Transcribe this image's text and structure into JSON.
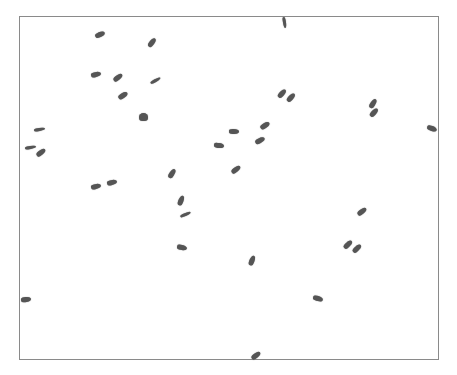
{
  "image": {
    "width": 457,
    "height": 375,
    "background": "#ffffff",
    "frame": {
      "left": 19,
      "top": 16,
      "right": 439,
      "bottom": 360,
      "border_color": "#8a8a8a"
    },
    "particle_color": "#555555",
    "particles": [
      {
        "x": 100,
        "y": 34,
        "angle": -25,
        "shape": "normal"
      },
      {
        "x": 152,
        "y": 42,
        "angle": -55,
        "shape": "normal"
      },
      {
        "x": 284,
        "y": 22,
        "angle": 80,
        "shape": "thin"
      },
      {
        "x": 96,
        "y": 74,
        "angle": -15,
        "shape": "normal"
      },
      {
        "x": 118,
        "y": 77,
        "angle": -40,
        "shape": "normal"
      },
      {
        "x": 155,
        "y": 80,
        "angle": -30,
        "shape": "thin"
      },
      {
        "x": 123,
        "y": 95,
        "angle": -35,
        "shape": "normal"
      },
      {
        "x": 143,
        "y": 117,
        "angle": 0,
        "shape": "blob"
      },
      {
        "x": 282,
        "y": 93,
        "angle": -50,
        "shape": "normal"
      },
      {
        "x": 291,
        "y": 97,
        "angle": -50,
        "shape": "normal"
      },
      {
        "x": 373,
        "y": 103,
        "angle": -60,
        "shape": "normal"
      },
      {
        "x": 374,
        "y": 112,
        "angle": -50,
        "shape": "normal"
      },
      {
        "x": 432,
        "y": 128,
        "angle": 20,
        "shape": "normal"
      },
      {
        "x": 39,
        "y": 129,
        "angle": -10,
        "shape": "thin"
      },
      {
        "x": 30,
        "y": 147,
        "angle": -10,
        "shape": "thin"
      },
      {
        "x": 41,
        "y": 152,
        "angle": -40,
        "shape": "normal"
      },
      {
        "x": 234,
        "y": 131,
        "angle": 0,
        "shape": "normal"
      },
      {
        "x": 265,
        "y": 125,
        "angle": -35,
        "shape": "normal"
      },
      {
        "x": 219,
        "y": 145,
        "angle": 5,
        "shape": "normal"
      },
      {
        "x": 260,
        "y": 140,
        "angle": -30,
        "shape": "normal"
      },
      {
        "x": 236,
        "y": 169,
        "angle": -40,
        "shape": "normal"
      },
      {
        "x": 172,
        "y": 173,
        "angle": -60,
        "shape": "normal"
      },
      {
        "x": 96,
        "y": 186,
        "angle": -15,
        "shape": "normal"
      },
      {
        "x": 112,
        "y": 182,
        "angle": -15,
        "shape": "normal"
      },
      {
        "x": 181,
        "y": 200,
        "angle": -70,
        "shape": "normal"
      },
      {
        "x": 185,
        "y": 214,
        "angle": -25,
        "shape": "thin"
      },
      {
        "x": 182,
        "y": 247,
        "angle": 10,
        "shape": "normal"
      },
      {
        "x": 362,
        "y": 211,
        "angle": -40,
        "shape": "normal"
      },
      {
        "x": 348,
        "y": 244,
        "angle": -45,
        "shape": "normal"
      },
      {
        "x": 357,
        "y": 248,
        "angle": -45,
        "shape": "normal"
      },
      {
        "x": 252,
        "y": 260,
        "angle": -70,
        "shape": "normal"
      },
      {
        "x": 318,
        "y": 298,
        "angle": 15,
        "shape": "normal"
      },
      {
        "x": 26,
        "y": 299,
        "angle": -10,
        "shape": "normal"
      },
      {
        "x": 256,
        "y": 355,
        "angle": -40,
        "shape": "normal"
      }
    ]
  }
}
